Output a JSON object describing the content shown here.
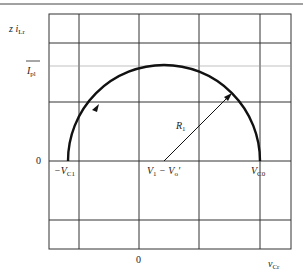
{
  "diagram": {
    "type": "state-plane trajectory",
    "y_axis_label": {
      "prefix": "z i",
      "sub": "Lr"
    },
    "x_axis_label": {
      "main": "v",
      "sub": "Cr"
    },
    "y_ticks": {
      "peak": {
        "main": "I",
        "sub": "pl",
        "overbar": true
      },
      "zero": "0"
    },
    "x_ticks": {
      "zero": "0"
    },
    "points": {
      "neg_vc1": {
        "main": "−V",
        "sub": "C1"
      },
      "center": {
        "a": "V",
        "a_sub": "1",
        "mid": " − ",
        "b": "V",
        "b_sub": "o",
        "b_sup": "′"
      },
      "vc0": {
        "main": "V",
        "sub": "C0"
      }
    },
    "radius_label": {
      "main": "R",
      "sub": "1"
    },
    "colors": {
      "grid": "#333333",
      "curve": "#111111",
      "background": "#ffffff"
    }
  }
}
